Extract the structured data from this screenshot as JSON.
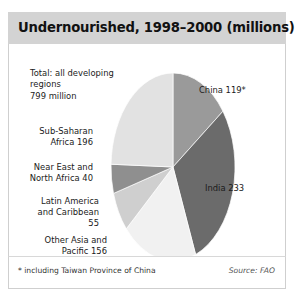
{
  "chart": {
    "title": "Undernourished, 1998–2000 (millions)",
    "total_note": "Total: all developing\nregions\n799 million",
    "footnote": "* including Taiwan Province of China",
    "source": "Source: FAO"
  },
  "labels": {
    "china": "China 119*",
    "india": "India 233",
    "subsaharan": "Sub-Saharan\nAfrica 196",
    "neareast": "Near East and\nNorth Africa 40",
    "latin": "Latin America\nand Caribbean\n55",
    "otherasia": "Other Asia and\nPacific 156"
  },
  "chart_data": {
    "type": "pie",
    "title": "Undernourished, 1998–2000 (millions)",
    "unit": "millions of people",
    "total": 799,
    "total_label": "Total: all developing regions 799 million",
    "categories": [
      "China",
      "India",
      "Other Asia and Pacific",
      "Latin America and Caribbean",
      "Near East and North Africa",
      "Sub-Saharan Africa"
    ],
    "values": [
      119,
      233,
      156,
      55,
      40,
      196
    ],
    "labels": [
      "China 119*",
      "India 233",
      "Other Asia and Pacific 156",
      "Latin America and Caribbean 55",
      "Near East and North Africa 40",
      "Sub-Saharan Africa 196"
    ],
    "colors": [
      "#9a9a9a",
      "#6b6b6b",
      "#f1f1f1",
      "#cfcfcf",
      "#8f8f8f",
      "#e2e2e2"
    ],
    "start_angle_deg": 0,
    "direction": "clockwise",
    "legend": "none",
    "labels_position": "outside",
    "annotations": [
      "* including Taiwan Province of China",
      "Source: FAO"
    ]
  },
  "style": {
    "title_bar_color": "#d3d3d3",
    "frame_border_color": "#cfcfcf",
    "background": "#ffffff"
  }
}
